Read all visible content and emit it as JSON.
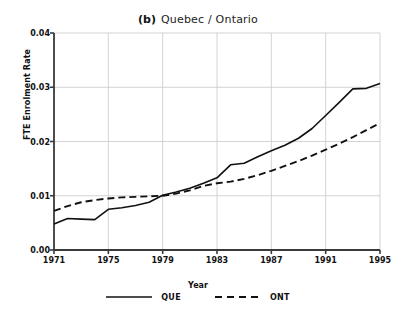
{
  "chart_data": {
    "type": "line",
    "panel_letter": "(b)",
    "title_text": "Quebec / Ontario",
    "xlabel": "Year",
    "ylabel": "FTE Enrolment Rate",
    "xlim": [
      1971,
      1995
    ],
    "ylim": [
      0.0,
      0.04
    ],
    "xticks": [
      1971,
      1975,
      1979,
      1983,
      1987,
      1991,
      1995
    ],
    "xtick_labels": [
      "1971",
      "1975",
      "1979",
      "1983",
      "1987",
      "1991",
      "1995"
    ],
    "yticks": [
      0.0,
      0.01,
      0.02,
      0.03,
      0.04
    ],
    "ytick_labels": [
      "0.00",
      "0.01",
      "0.02",
      "0.03",
      "0.04"
    ],
    "grid": true,
    "grid_color": "#c8c8c8",
    "axis_color": "#3a3a3a",
    "legend_position": "below-axes",
    "x": [
      1971,
      1972,
      1973,
      1974,
      1975,
      1976,
      1977,
      1978,
      1979,
      1980,
      1981,
      1982,
      1983,
      1984,
      1985,
      1986,
      1987,
      1988,
      1989,
      1990,
      1991,
      1992,
      1993,
      1994,
      1995
    ],
    "series": [
      {
        "name": "QUE",
        "label": "QUE",
        "style": "solid",
        "color": "#111111",
        "values": [
          0.0048,
          0.0058,
          0.0057,
          0.0056,
          0.0075,
          0.0078,
          0.0082,
          0.0088,
          0.0101,
          0.0107,
          0.0114,
          0.0123,
          0.0133,
          0.0157,
          0.016,
          0.0172,
          0.0183,
          0.0193,
          0.0206,
          0.0224,
          0.0248,
          0.0272,
          0.0297,
          0.0298,
          0.0307
        ]
      },
      {
        "name": "ONT",
        "label": "ONT",
        "style": "dashed",
        "color": "#111111",
        "values": [
          0.0072,
          0.0081,
          0.0088,
          0.0092,
          0.0095,
          0.0097,
          0.0098,
          0.0099,
          0.01,
          0.0104,
          0.011,
          0.0118,
          0.0123,
          0.0126,
          0.0131,
          0.0138,
          0.0146,
          0.0155,
          0.0164,
          0.0174,
          0.0185,
          0.0196,
          0.0208,
          0.0221,
          0.0234
        ]
      }
    ],
    "legend": [
      {
        "label": "QUE",
        "style": "solid"
      },
      {
        "label": "ONT",
        "style": "dashed"
      }
    ]
  }
}
